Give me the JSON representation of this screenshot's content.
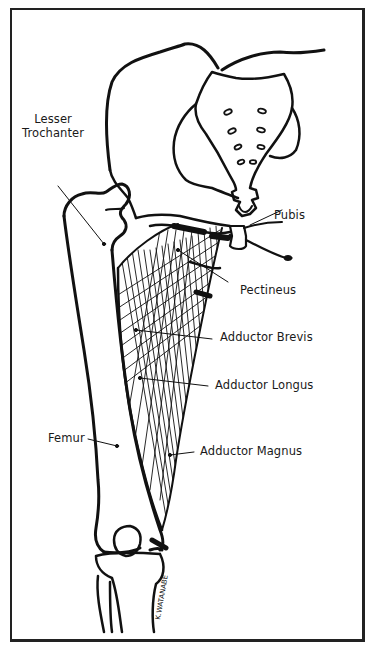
{
  "diagram": {
    "type": "anatomical illustration",
    "labels": {
      "lesser_trochanter_line1": "Lesser",
      "lesser_trochanter_line2": "Trochanter",
      "pubis": "Pubis",
      "pectineus": "Pectineus",
      "adductor_brevis": "Adductor Brevis",
      "adductor_longus": "Adductor Longus",
      "femur": "Femur",
      "adductor_magnus": "Adductor Magnus"
    },
    "signature": "K.WATANABE",
    "colors": {
      "ink": "#111111",
      "background": "#ffffff",
      "border": "#222222"
    }
  }
}
